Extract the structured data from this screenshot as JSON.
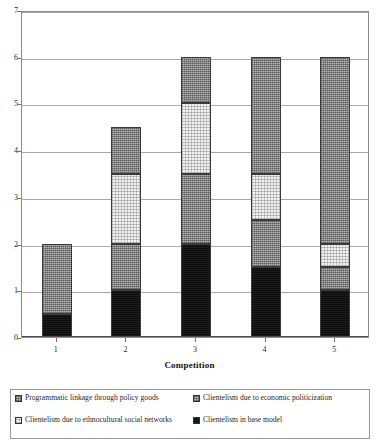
{
  "chart_data": {
    "type": "bar",
    "subtype": "stacked-bar",
    "title": "",
    "xlabel": "Competition",
    "ylabel": "",
    "categories": [
      "1",
      "2",
      "3",
      "4",
      "5"
    ],
    "ylim": [
      0,
      7
    ],
    "yticks": [
      "0",
      "1",
      "2",
      "3",
      "4",
      "5",
      "6",
      "7"
    ],
    "grid": true,
    "legend_position": "bottom",
    "series": [
      {
        "name": "Clientelism in base model",
        "fill": "solid-black",
        "color": "#0d0d0d",
        "values": [
          0.5,
          1,
          2,
          1.5,
          1
        ]
      },
      {
        "name": "Clientelism due to ethnocultural social networks",
        "fill": "medium-gray-dither",
        "color": "#b9b9b9",
        "values": [
          1.5,
          1,
          1.5,
          1,
          0.5
        ]
      },
      {
        "name": "Clientelism due to economic politicization",
        "fill": "light-dotted",
        "color": "#f2f2f2",
        "values": [
          0,
          1.5,
          1.5,
          1,
          0.5
        ]
      },
      {
        "name": "Programmatic linkage through policy goods",
        "fill": "medium-gray-dither",
        "color": "#b9b9b9",
        "values": [
          0,
          1,
          1,
          2.5,
          4
        ]
      }
    ],
    "totals": [
      2,
      5,
      6,
      6,
      6
    ]
  },
  "axes": {
    "x_title": "Competition",
    "x_tick_labels": [
      "1",
      "2",
      "3",
      "4",
      "5"
    ],
    "y_tick_labels": [
      "7",
      "6",
      "5",
      "4",
      "3",
      "2",
      "1",
      "0"
    ]
  },
  "legend": {
    "left_column": [
      {
        "label": "Programmatic linkage through policy goods",
        "swatch": "medium-gray-dither"
      },
      {
        "label": "Clientelism due to ethnocultural social networks",
        "swatch": "light-dotted"
      }
    ],
    "right_column": [
      {
        "label": "Clientelism due to economic politicization",
        "swatch": "medium-gray-dither"
      },
      {
        "label": "Clientelism in base model",
        "swatch": "solid-black"
      }
    ]
  }
}
